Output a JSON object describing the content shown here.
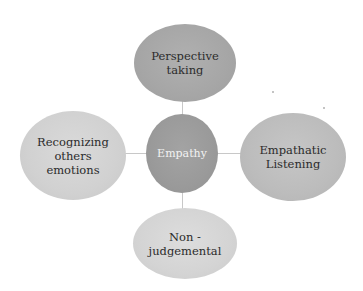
{
  "diagram": {
    "center": {
      "label": "Empathy",
      "fill": "#9b9b9b",
      "text_color": "#f2f2f2"
    },
    "nodes": [
      {
        "id": "top",
        "label": "Perspective\ntaking",
        "fill": "#a9a9a9"
      },
      {
        "id": "left",
        "label": "Recognizing\nothers\nemotions",
        "fill": "#d3d3d3"
      },
      {
        "id": "right",
        "label": "Empathatic\nListening",
        "fill": "#bebebe"
      },
      {
        "id": "bottom",
        "label": "Non -\njudgemental",
        "fill": "#d6d6d6"
      }
    ],
    "connector_color": "#c8c8c8"
  }
}
